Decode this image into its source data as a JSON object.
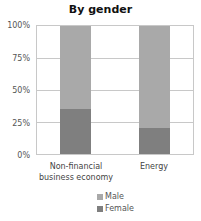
{
  "chart_data": {
    "type": "bar",
    "stacked": true,
    "title": "By gender",
    "xlabel": "",
    "ylabel": "",
    "categories": [
      "Non-financial business economy",
      "Energy"
    ],
    "category_lines": [
      [
        "Non-financial",
        "business economy"
      ],
      [
        "Energy"
      ]
    ],
    "series": [
      {
        "name": "Female",
        "values": [
          35,
          20
        ],
        "color": "#7f7f7f"
      },
      {
        "name": "Male",
        "values": [
          65,
          80
        ],
        "color": "#a9a9a9"
      }
    ],
    "ylim": [
      0,
      100
    ],
    "yticks": [
      "0%",
      "25%",
      "50%",
      "75%",
      "100%"
    ],
    "grid": true,
    "legend_position": "bottom",
    "legend": [
      "Male",
      "Female"
    ]
  },
  "labels": {
    "title": "By gender",
    "y0": "0%",
    "y25": "25%",
    "y50": "50%",
    "y75": "75%",
    "y100": "100%",
    "cat1_line1": "Non-financial",
    "cat1_line2": "business economy",
    "cat2": "Energy",
    "legend_male": "Male",
    "legend_female": "Female"
  }
}
